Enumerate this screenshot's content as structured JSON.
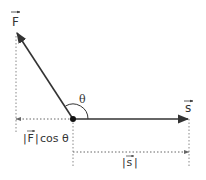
{
  "diagram": {
    "labels": {
      "force": "F",
      "displacement": "s",
      "angle": "θ",
      "projection": "|F| cos θ",
      "projection_abs_open": "|",
      "projection_F": "F",
      "projection_abs_close": "|",
      "projection_cos": "cos θ",
      "magnitude_s_open": "|",
      "magnitude_s": "s",
      "magnitude_s_close": "|"
    },
    "colors": {
      "vector": "#333333",
      "dotted": "#777777",
      "origin": "#111111"
    }
  }
}
